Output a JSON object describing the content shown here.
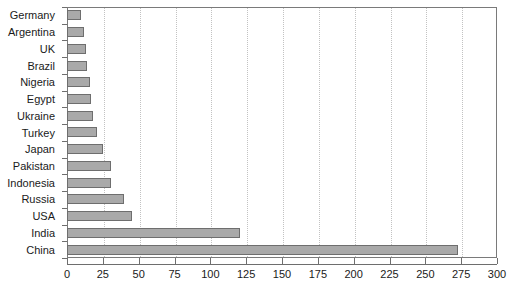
{
  "chart_data": {
    "type": "bar",
    "orientation": "horizontal",
    "title": "",
    "xlabel": "",
    "ylabel": "",
    "xlim": [
      0,
      300
    ],
    "ylim": null,
    "grid": "vertical-dotted",
    "legend": "none",
    "xticks": [
      0,
      25,
      50,
      75,
      100,
      125,
      150,
      175,
      200,
      225,
      250,
      275,
      300
    ],
    "xtick_labels": [
      "0",
      "25",
      "50",
      "75",
      "100",
      "125",
      "150",
      "175",
      "200",
      "225",
      "250",
      "275",
      "300"
    ],
    "categories": [
      "Germany",
      "Argentina",
      "UK",
      "Brazil",
      "Nigeria",
      "Egypt",
      "Ukraine",
      "Turkey",
      "Japan",
      "Pakistan",
      "Indonesia",
      "Russia",
      "USA",
      "India",
      "China"
    ],
    "values": [
      10,
      12,
      13,
      14,
      16,
      17,
      18,
      21,
      25,
      31,
      31,
      40,
      45,
      121,
      273
    ],
    "bar_color": "#a9a9a9",
    "bar_edge_color": "#6e6e6e",
    "grid_color": "#c2c2c2",
    "axis_color": "#6e6e6e",
    "background_color": "#ffffff",
    "text_color": "#1a1a1a"
  }
}
